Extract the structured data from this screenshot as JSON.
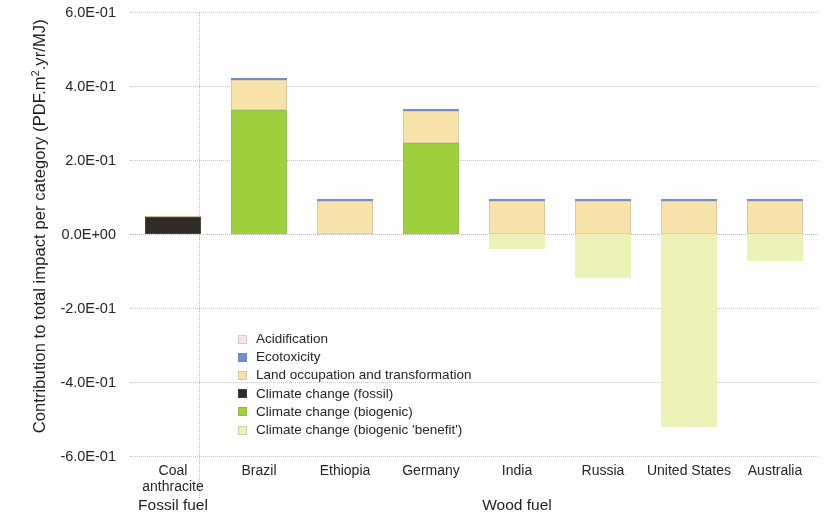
{
  "chart_data": {
    "type": "bar",
    "title": "",
    "subtitle": "",
    "ylabel": "Contribution to total impact per category (PDF.m2.yr/MJ)",
    "ylabel_parts": {
      "pre": "Contribution to total impact per category (PDF.m",
      "sup": "2",
      "post": ".yr/MJ)"
    },
    "xlabel": "",
    "stacked": true,
    "grid": true,
    "legend_position": "inside-lower-left",
    "ylim": [
      -0.6,
      0.6
    ],
    "ytick_values": [
      0.6,
      0.4,
      0.2,
      0.0,
      -0.2,
      -0.4,
      -0.6
    ],
    "ytick_labels": [
      "6.0E-01",
      "4.0E-01",
      "2.0E-01",
      "0.0E+00",
      "-2.0E-01",
      "-4.0E-01",
      "-6.0E-01"
    ],
    "categories": [
      "Coal anthracite",
      "Brazil",
      "Ethiopia",
      "Germany",
      "India",
      "Russia",
      "United States",
      "Australia"
    ],
    "category_lines": [
      [
        "Coal",
        "anthracite"
      ],
      [
        "Brazil"
      ],
      [
        "Ethiopia"
      ],
      [
        "Germany"
      ],
      [
        "India"
      ],
      [
        "Russia"
      ],
      [
        "United States"
      ],
      [
        "Australia"
      ]
    ],
    "groups": [
      {
        "label": "Fossil fuel",
        "categories": [
          "Coal anthracite"
        ]
      },
      {
        "label": "Wood fuel",
        "categories": [
          "Brazil",
          "Ethiopia",
          "Germany",
          "India",
          "Russia",
          "United States",
          "Australia"
        ]
      }
    ],
    "series": [
      {
        "name": "Acidification",
        "color": "#f3e7ea",
        "values": [
          0.0,
          0.0,
          0.0,
          0.0,
          0.0,
          0.0,
          0.0,
          0.0
        ]
      },
      {
        "name": "Ecotoxicity",
        "color": "#6f8fd4",
        "values": [
          0.0,
          0.006,
          0.004,
          0.005,
          0.004,
          0.004,
          0.004,
          0.004
        ]
      },
      {
        "name": "Land occupation and transformation",
        "color": "#f8e3ab",
        "values": [
          0.004,
          0.082,
          0.09,
          0.086,
          0.09,
          0.09,
          0.09,
          0.09
        ]
      },
      {
        "name": "Climate change (fossil)",
        "color": "#312b25",
        "values": [
          0.045,
          0.0,
          0.0,
          0.0,
          0.0,
          0.0,
          0.0,
          0.0
        ]
      },
      {
        "name": "Climate change (biogenic)",
        "color": "#9ed13c",
        "values": [
          0.0,
          0.334,
          0.0,
          0.247,
          0.0,
          0.0,
          0.0,
          0.0
        ]
      },
      {
        "name": "Climate change (biogenic 'benefit')",
        "color": "#ecf2b8",
        "values": [
          0.0,
          0.0,
          0.0,
          0.0,
          -0.04,
          -0.12,
          -0.522,
          -0.072
        ]
      }
    ],
    "totals_positive": [
      0.049,
      0.422,
      0.094,
      0.338,
      0.094,
      0.094,
      0.094,
      0.094
    ],
    "totals_negative": [
      0.0,
      0.0,
      0.0,
      0.0,
      -0.04,
      -0.12,
      -0.522,
      -0.072
    ]
  },
  "legend": {
    "items": [
      {
        "label": "Acidification",
        "color": "#f3e7ea"
      },
      {
        "label": "Ecotoxicity",
        "color": "#6f8fd4"
      },
      {
        "label": "Land occupation and transformation",
        "color": "#f8e3ab"
      },
      {
        "label": "Climate change (fossil)",
        "color": "#312b25"
      },
      {
        "label": "Climate change (biogenic)",
        "color": "#9ed13c"
      },
      {
        "label": "Climate change (biogenic 'benefit')",
        "color": "#ecf2b8"
      }
    ]
  }
}
